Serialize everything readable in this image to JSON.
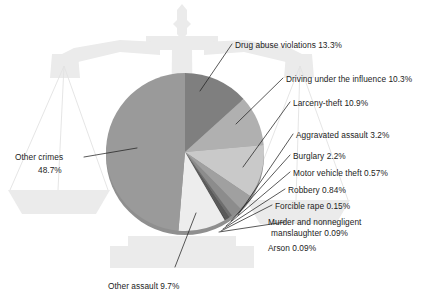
{
  "chart_data": {
    "type": "pie",
    "title": "",
    "subtitle": "",
    "xlabel": "",
    "ylabel": "",
    "legend_position": "callout-labels",
    "grid": false,
    "start_angle_deg": 0,
    "direction": "clockwise",
    "units": "percent",
    "categories": [
      "Drug abuse violations",
      "Driving under the influence",
      "Larceny-theft",
      "Aggravated assault",
      "Burglary",
      "Motor vehicle theft",
      "Robbery",
      "Forcible rape",
      "Murder and nonnegligent manslaughter",
      "Arson",
      "Other assault",
      "Other crimes"
    ],
    "values": [
      13.3,
      10.3,
      10.9,
      3.2,
      2.2,
      0.57,
      0.84,
      0.15,
      0.09,
      0.09,
      9.7,
      48.7
    ],
    "value_labels": [
      "13.3%",
      "10.3%",
      "10.9%",
      "3.2%",
      "2.2%",
      "0.57%",
      "0.84%",
      "0.15%",
      "0.09%",
      "0.09%",
      "9.7%",
      "48.7%"
    ],
    "slice_colors": [
      "#7f7f7f",
      "#b0b0b0",
      "#c9c9c9",
      "#a0a0a0",
      "#8c8c8c",
      "#6e6e6e",
      "#5a5a5a",
      "#474747",
      "#3a3a3a",
      "#2e2e2e",
      "#ededed",
      "#9a9a9a"
    ],
    "slices": [
      {
        "label": "Drug abuse violations",
        "value": 13.3,
        "value_label": "13.3%",
        "color": "#7f7f7f"
      },
      {
        "label": "Driving under the influence",
        "value": 10.3,
        "value_label": "10.3%",
        "color": "#b0b0b0"
      },
      {
        "label": "Larceny-theft",
        "value": 10.9,
        "value_label": "10.9%",
        "color": "#c9c9c9"
      },
      {
        "label": "Aggravated assault",
        "value": 3.2,
        "value_label": "3.2%",
        "color": "#a0a0a0"
      },
      {
        "label": "Burglary",
        "value": 2.2,
        "value_label": "2.2%",
        "color": "#8c8c8c"
      },
      {
        "label": "Motor vehicle theft",
        "value": 0.57,
        "value_label": "0.57%",
        "color": "#6e6e6e"
      },
      {
        "label": "Robbery",
        "value": 0.84,
        "value_label": "0.84%",
        "color": "#5a5a5a"
      },
      {
        "label": "Forcible rape",
        "value": 0.15,
        "value_label": "0.15%",
        "color": "#474747"
      },
      {
        "label": "Murder and nonnegligent manslaughter",
        "value": 0.09,
        "value_label": "0.09%",
        "color": "#3a3a3a"
      },
      {
        "label": "Arson",
        "value": 0.09,
        "value_label": "0.09%",
        "color": "#2e2e2e"
      },
      {
        "label": "Other assault",
        "value": 9.7,
        "value_label": "9.7%",
        "color": "#ededed"
      },
      {
        "label": "Other crimes",
        "value": 48.7,
        "value_label": "48.7%",
        "color": "#9a9a9a"
      }
    ]
  },
  "callouts": {
    "drug_abuse": "Drug abuse violations 13.3%",
    "dui": "Driving under the influence 10.3%",
    "larceny": "Larceny-theft 10.9%",
    "aggravated": "Aggravated assault 3.2%",
    "burglary": "Burglary 2.2%",
    "motor_vehicle": "Motor vehicle theft 0.57%",
    "robbery": "Robbery 0.84%",
    "forcible_rape": "Forcible rape 0.15%",
    "murder_line1": "Murder and nonnegligent",
    "murder_line2": "manslaughter 0.09%",
    "arson": "Arson 0.09%",
    "other_assault": "Other assault 9.7%",
    "other_crimes_line1": "Other crimes",
    "other_crimes_line2": "48.7%"
  },
  "background": {
    "watermark_name": "scales-of-justice",
    "watermark_color": "#eaeaea",
    "page_color": "#ffffff"
  },
  "style": {
    "leader_line_color": "#222222",
    "pie_rim_color": "#8a8a8a",
    "text_color": "#1c1c1c"
  }
}
